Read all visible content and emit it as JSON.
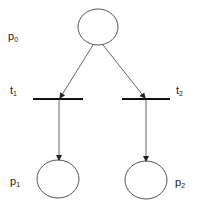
{
  "diagram": {
    "type": "petri-net",
    "places": [
      {
        "id": "p0",
        "label": "p",
        "sub": "0"
      },
      {
        "id": "p1",
        "label": "p",
        "sub": "1"
      },
      {
        "id": "p2",
        "label": "p",
        "sub": "2"
      }
    ],
    "transitions": [
      {
        "id": "t1",
        "label": "t",
        "sub": "1"
      },
      {
        "id": "t2",
        "label": "t",
        "sub": "2"
      }
    ],
    "arcs": [
      {
        "from": "p0",
        "to": "t1"
      },
      {
        "from": "p0",
        "to": "t2"
      },
      {
        "from": "t1",
        "to": "p1"
      },
      {
        "from": "t2",
        "to": "p2"
      }
    ],
    "colors": {
      "stroke": "#555555",
      "bar": "#111111",
      "background": "#ffffff"
    }
  }
}
